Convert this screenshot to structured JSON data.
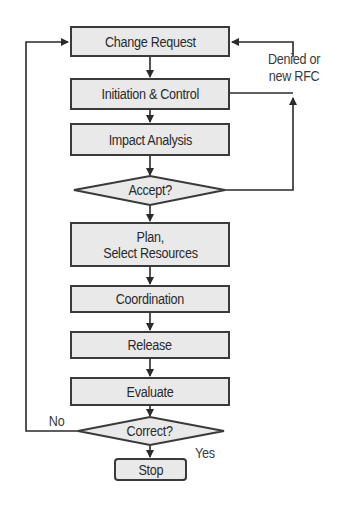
{
  "diagram": {
    "type": "flowchart",
    "colors": {
      "box_fill": "#e9e9e9",
      "stroke": "#3a3a3a",
      "text": "#2a2a2a",
      "background": "#ffffff"
    },
    "nodes": [
      {
        "id": "change_request",
        "shape": "rect",
        "label": "Change Request"
      },
      {
        "id": "initiation_control",
        "shape": "rect",
        "label": "Initiation & Control"
      },
      {
        "id": "impact_analysis",
        "shape": "rect",
        "label": "Impact Analysis"
      },
      {
        "id": "accept",
        "shape": "diamond",
        "label": "Accept?"
      },
      {
        "id": "plan",
        "shape": "rect",
        "label_line1": "Plan,",
        "label_line2": "Select Resources"
      },
      {
        "id": "coordination",
        "shape": "rect",
        "label": "Coordination"
      },
      {
        "id": "release",
        "shape": "rect",
        "label": "Release"
      },
      {
        "id": "evaluate",
        "shape": "rect",
        "label": "Evaluate"
      },
      {
        "id": "correct",
        "shape": "diamond",
        "label": "Correct?"
      },
      {
        "id": "stop",
        "shape": "rounded-rect",
        "label": "Stop"
      }
    ],
    "edge_labels": {
      "denied_line1": "Denied or",
      "denied_line2": "new RFC",
      "no": "No",
      "yes": "Yes"
    }
  }
}
